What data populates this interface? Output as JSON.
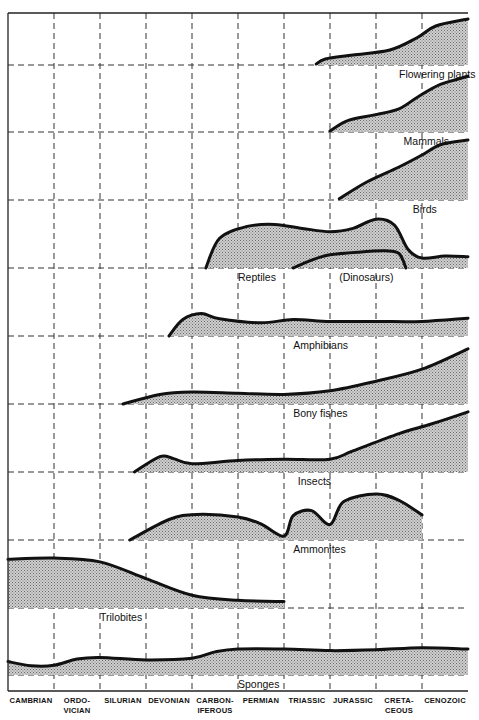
{
  "chart_data": {
    "type": "area",
    "title": "",
    "xlabel": "Geological period",
    "ylabel": "Relative abundance (stacked bands per group)",
    "grid": true,
    "categories": [
      "CAMBRIAN",
      "ORDO-VICIAN",
      "SILURIAN",
      "DEVONIAN",
      "CARBON-IFEROUS",
      "PERMIAN",
      "TRIASSIC",
      "JURASSIC",
      "CRETA-CEOUS",
      "CENOZOIC"
    ],
    "category_lines": [
      [
        "CAMBRIAN"
      ],
      [
        "ORDO-",
        "VICIAN"
      ],
      [
        "SILURIAN"
      ],
      [
        "DEVONIAN"
      ],
      [
        "CARBON-",
        "IFEROUS"
      ],
      [
        "PERMIAN"
      ],
      [
        "TRIASSIC"
      ],
      [
        "JURASSIC"
      ],
      [
        "CRETA-",
        "CEOUS"
      ],
      [
        "CENOZOIC"
      ]
    ],
    "x_note": "x in chart units 0-10 (one unit per period), y = relative abundance 0-1 within each band",
    "series": [
      {
        "name": "Flowering plants",
        "label": "Flowering plants",
        "label_x": 8.5,
        "points": [
          [
            6.7,
            0.02
          ],
          [
            6.9,
            0.12
          ],
          [
            7.5,
            0.2
          ],
          [
            8.3,
            0.3
          ],
          [
            8.9,
            0.55
          ],
          [
            9.3,
            0.78
          ],
          [
            10,
            0.92
          ]
        ]
      },
      {
        "name": "Mammals",
        "label": "Mammals",
        "label_x": 8.6,
        "points": [
          [
            7.0,
            0.02
          ],
          [
            7.4,
            0.2
          ],
          [
            8.0,
            0.3
          ],
          [
            8.5,
            0.4
          ],
          [
            8.9,
            0.6
          ],
          [
            9.4,
            0.82
          ],
          [
            10,
            0.96
          ]
        ]
      },
      {
        "name": "Birds",
        "label": "Birds",
        "label_x": 8.8,
        "points": [
          [
            7.2,
            0.02
          ],
          [
            7.8,
            0.3
          ],
          [
            8.5,
            0.55
          ],
          [
            9.0,
            0.75
          ],
          [
            9.4,
            0.92
          ],
          [
            10,
            1.0
          ]
        ]
      },
      {
        "name": "Reptiles",
        "label": "Reptiles",
        "label_x": 5.0,
        "points": [
          [
            4.3,
            0.0
          ],
          [
            4.6,
            0.45
          ],
          [
            5.2,
            0.63
          ],
          [
            5.8,
            0.66
          ],
          [
            6.4,
            0.6
          ],
          [
            7.0,
            0.55
          ],
          [
            7.5,
            0.6
          ],
          [
            8.0,
            0.74
          ],
          [
            8.4,
            0.65
          ],
          [
            8.7,
            0.28
          ],
          [
            9.0,
            0.15
          ],
          [
            9.5,
            0.18
          ],
          [
            10,
            0.17
          ]
        ]
      },
      {
        "name": "Dinosaurs",
        "label": "(Dinosaurs)",
        "label_x": 7.2,
        "points": [
          [
            6.2,
            0.0
          ],
          [
            6.6,
            0.12
          ],
          [
            7.0,
            0.2
          ],
          [
            7.6,
            0.24
          ],
          [
            8.2,
            0.26
          ],
          [
            8.5,
            0.22
          ],
          [
            8.65,
            0.0
          ]
        ]
      },
      {
        "name": "Amphibians",
        "label": "Amphibians",
        "label_x": 6.2,
        "points": [
          [
            3.5,
            0.0
          ],
          [
            3.8,
            0.25
          ],
          [
            4.2,
            0.34
          ],
          [
            4.6,
            0.26
          ],
          [
            5.5,
            0.2
          ],
          [
            6.2,
            0.25
          ],
          [
            7.0,
            0.22
          ],
          [
            8.0,
            0.22
          ],
          [
            9.0,
            0.22
          ],
          [
            10,
            0.27
          ]
        ]
      },
      {
        "name": "Bony fishes",
        "label": "Bony fishes",
        "label_x": 6.2,
        "points": [
          [
            2.5,
            0.0
          ],
          [
            3.3,
            0.16
          ],
          [
            4.0,
            0.2
          ],
          [
            5.0,
            0.18
          ],
          [
            6.0,
            0.16
          ],
          [
            7.0,
            0.22
          ],
          [
            8.0,
            0.38
          ],
          [
            9.0,
            0.58
          ],
          [
            10,
            0.92
          ]
        ]
      },
      {
        "name": "Insects",
        "label": "Insects",
        "label_x": 6.3,
        "points": [
          [
            2.75,
            0.0
          ],
          [
            3.3,
            0.24
          ],
          [
            3.6,
            0.21
          ],
          [
            4.0,
            0.13
          ],
          [
            5.0,
            0.18
          ],
          [
            6.0,
            0.2
          ],
          [
            7.0,
            0.2
          ],
          [
            7.5,
            0.33
          ],
          [
            8.5,
            0.6
          ],
          [
            9.2,
            0.75
          ],
          [
            10,
            0.94
          ]
        ]
      },
      {
        "name": "Ammonites",
        "label": "Ammonites",
        "label_x": 6.2,
        "points": [
          [
            2.65,
            0.0
          ],
          [
            3.5,
            0.32
          ],
          [
            4.1,
            0.4
          ],
          [
            5.0,
            0.36
          ],
          [
            5.5,
            0.25
          ],
          [
            6.0,
            0.06
          ],
          [
            6.2,
            0.38
          ],
          [
            6.6,
            0.46
          ],
          [
            7.0,
            0.24
          ],
          [
            7.3,
            0.6
          ],
          [
            8.0,
            0.72
          ],
          [
            8.5,
            0.62
          ],
          [
            9.0,
            0.39
          ]
        ]
      },
      {
        "name": "Trilobites",
        "label": "Trilobites",
        "label_x": 2.0,
        "points": [
          [
            0,
            0.76
          ],
          [
            1.0,
            0.78
          ],
          [
            2.0,
            0.72
          ],
          [
            3.0,
            0.46
          ],
          [
            4.0,
            0.2
          ],
          [
            5.0,
            0.12
          ],
          [
            6.0,
            0.1
          ]
        ]
      },
      {
        "name": "Sponges",
        "label": "Sponges",
        "label_x": 5.0,
        "points": [
          [
            0,
            0.32
          ],
          [
            0.5,
            0.22
          ],
          [
            1.0,
            0.23
          ],
          [
            1.5,
            0.38
          ],
          [
            2.0,
            0.42
          ],
          [
            3.0,
            0.36
          ],
          [
            4.0,
            0.4
          ],
          [
            4.5,
            0.55
          ],
          [
            5.0,
            0.62
          ],
          [
            6.0,
            0.62
          ],
          [
            7.0,
            0.58
          ],
          [
            8.0,
            0.6
          ],
          [
            9.0,
            0.65
          ],
          [
            10,
            0.62
          ]
        ]
      }
    ]
  }
}
